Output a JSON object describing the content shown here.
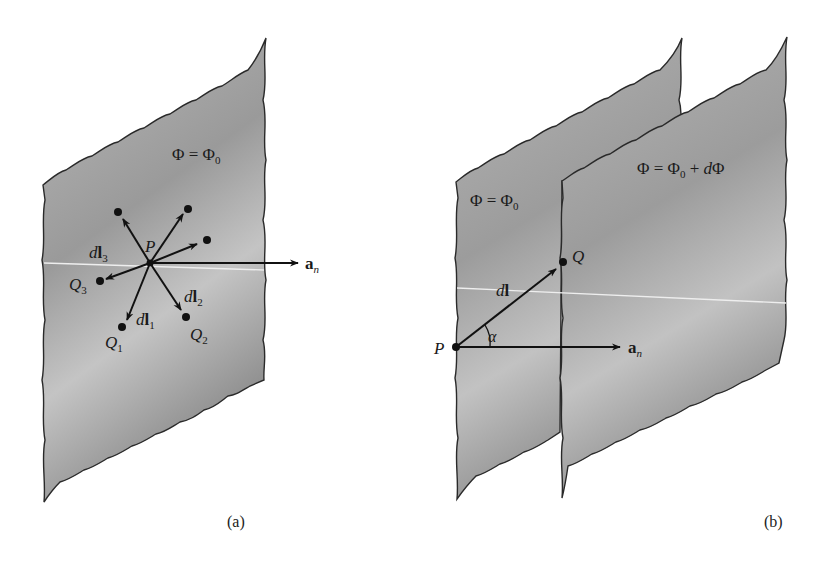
{
  "figure": {
    "panel_a": {
      "caption": "(a)",
      "surface_label": {
        "lhs": "Φ",
        "eq": " = ",
        "rhs": "Φ",
        "rhs_sub": "0"
      },
      "point_label": "P",
      "normal_vector": {
        "base": "a",
        "sub": "n"
      },
      "vectors": [
        {
          "d": "d",
          "l": "l",
          "sub": "1",
          "endpoint": "Q",
          "endpoint_sub": "1"
        },
        {
          "d": "d",
          "l": "l",
          "sub": "2",
          "endpoint": "Q",
          "endpoint_sub": "2"
        },
        {
          "d": "d",
          "l": "l",
          "sub": "3",
          "endpoint": "Q",
          "endpoint_sub": "3"
        }
      ]
    },
    "panel_b": {
      "caption": "(b)",
      "back_surface_label": {
        "lhs": "Φ",
        "eq": " = ",
        "rhs": "Φ",
        "rhs_sub": "0"
      },
      "front_surface_label": {
        "lhs": "Φ",
        "eq": " = ",
        "rhs": "Φ",
        "rhs_sub": "0",
        "plus": " + ",
        "d": "d",
        "dphi": "Φ"
      },
      "point_p": "P",
      "point_q": "Q",
      "displacement": {
        "d": "d",
        "l": "l"
      },
      "angle": "α",
      "normal_vector": {
        "base": "a",
        "sub": "n"
      }
    },
    "colors": {
      "surface_fill_light": "#d4d4d4",
      "surface_fill_dark": "#8e8e8e",
      "outline": "#2a2a2a",
      "ink": "#111111"
    }
  }
}
